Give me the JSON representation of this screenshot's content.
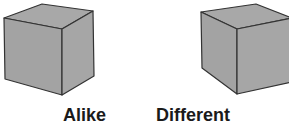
{
  "figure": {
    "cubes": [
      {
        "id": "alike",
        "label": "Alike",
        "fill": "#a3a3a3",
        "stroke": "#333333"
      },
      {
        "id": "different",
        "label": "Different",
        "fill": "#a3a3a3",
        "stroke": "#333333"
      }
    ]
  }
}
